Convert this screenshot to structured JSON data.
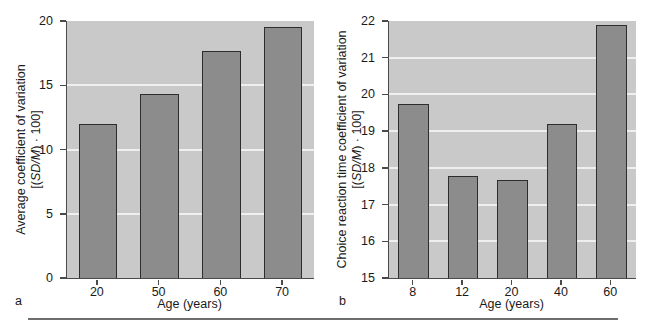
{
  "figure": {
    "background_color": "#ffffff",
    "plot_area_color": "#c9c9c9",
    "bar_fill_color": "#8c8c8c",
    "bar_edge_color": "#2d2d2d",
    "gridline_color": "#efefef",
    "axis_color": "#4a4a4a"
  },
  "panels": [
    {
      "letter": "a",
      "ylabel_line1": "Average coefficient of variation",
      "ylabel_line2_prefix": "[(",
      "ylabel_line2_italic": "SD/M",
      "ylabel_line2_suffix": ") · 100]",
      "xlabel": "Age (years)"
    },
    {
      "letter": "b",
      "ylabel_line1": "Choice reaction time coefficient of variation",
      "ylabel_line2_prefix": "[(",
      "ylabel_line2_italic": "SD/M",
      "ylabel_line2_suffix": ") · 100]",
      "xlabel": "Age (years)"
    }
  ],
  "chart_data": [
    {
      "type": "bar",
      "panel": "a",
      "title": "",
      "xlabel": "Age (years)",
      "ylabel": "Average coefficient of variation [(SD/M) · 100]",
      "categories": [
        "20",
        "50",
        "60",
        "70"
      ],
      "values": [
        12.0,
        14.3,
        17.7,
        19.5
      ],
      "ylim": [
        0,
        20
      ],
      "yticks": [
        0,
        5,
        10,
        15,
        20
      ],
      "ytick_labels": [
        "0",
        "5",
        "10",
        "15",
        "20"
      ],
      "grid": true,
      "legend": "none"
    },
    {
      "type": "bar",
      "panel": "b",
      "title": "",
      "xlabel": "Age (years)",
      "ylabel": "Choice reaction time coefficient of variation [(SD/M) · 100]",
      "categories": [
        "8",
        "12",
        "20",
        "40",
        "60"
      ],
      "values": [
        19.75,
        17.78,
        17.68,
        19.2,
        21.9
      ],
      "ylim": [
        15,
        22
      ],
      "yticks": [
        15,
        16,
        17,
        18,
        19,
        20,
        21,
        22
      ],
      "ytick_labels": [
        "15",
        "16",
        "17",
        "18",
        "19",
        "20",
        "21",
        "22"
      ],
      "grid": true,
      "legend": "none"
    }
  ]
}
